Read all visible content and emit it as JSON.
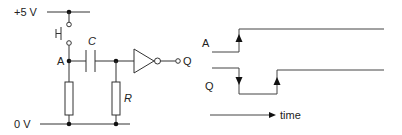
{
  "circuit": {
    "supply_label": "+5 V",
    "ground_label": "0 V",
    "node_a_label": "A",
    "capacitor_label": "C",
    "resistor_label": "R",
    "output_label": "Q"
  },
  "timing": {
    "signal_a_label": "A",
    "signal_q_label": "Q",
    "time_axis_label": "time"
  },
  "colors": {
    "line": "#333333",
    "background": "#ffffff"
  }
}
